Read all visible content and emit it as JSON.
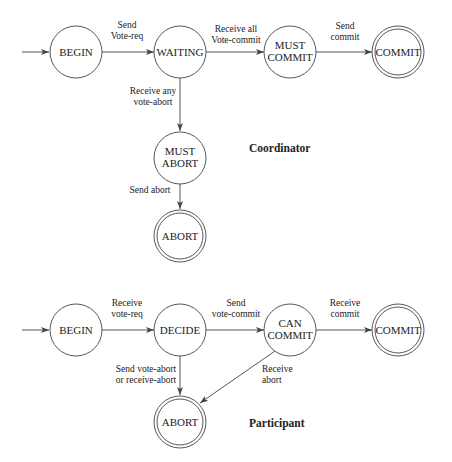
{
  "coordinator": {
    "title": "Coordinator",
    "states": {
      "begin": "BEGIN",
      "waiting": "WAITING",
      "must_commit_1": "MUST",
      "must_commit_2": "COMMIT",
      "commit": "COMMIT",
      "must_abort_1": "MUST",
      "must_abort_2": "ABORT",
      "abort": "ABORT"
    },
    "transitions": {
      "begin_waiting_1": "Send",
      "begin_waiting_2": "Vote-req",
      "waiting_mustcommit_1": "Receive all",
      "waiting_mustcommit_2": "Vote-commit",
      "mustcommit_commit_1": "Send",
      "mustcommit_commit_2": "commit",
      "waiting_mustabort_1": "Receive any",
      "waiting_mustabort_2": "vote-abort",
      "mustabort_abort": "Send abort"
    }
  },
  "participant": {
    "title": "Participant",
    "states": {
      "begin": "BEGIN",
      "decide": "DECIDE",
      "can_commit_1": "CAN",
      "can_commit_2": "COMMIT",
      "commit": "COMMIT",
      "abort": "ABORT"
    },
    "transitions": {
      "begin_decide_1": "Receive",
      "begin_decide_2": "vote-req",
      "decide_cancommit_1": "Send",
      "decide_cancommit_2": "vote-commit",
      "cancommit_commit_1": "Receive",
      "cancommit_commit_2": "commit",
      "decide_abort_1": "Send vote-abort",
      "decide_abort_2": "or receive-abort",
      "cancommit_abort_1": "Receive",
      "cancommit_abort_2": "abort"
    }
  }
}
